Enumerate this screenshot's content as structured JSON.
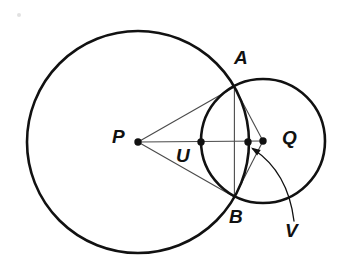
{
  "figure": {
    "title_hint": "two intersecting circles with common chord AB and center line PQ",
    "background": "#ffffff",
    "ink_color": "#111111",
    "thin_line_color": "#4a4a4a",
    "labels": {
      "P": {
        "text": "P",
        "style": "left:112px;top:127px"
      },
      "U": {
        "text": "U",
        "style": "left:176px;top:146px"
      },
      "Q": {
        "text": "Q",
        "style": "left:282px;top:128px"
      },
      "A": {
        "text": "A",
        "style": "left:234px;top:48px"
      },
      "B": {
        "text": "B",
        "style": "left:229px;top:207px"
      },
      "V": {
        "text": "V",
        "style": "left:285px;top:221px"
      }
    },
    "circles": [
      {
        "name": "circle-p",
        "cx": 138,
        "cy": 142,
        "r": 111,
        "stroke_width": 2.6
      },
      {
        "name": "circle-q",
        "cx": 263,
        "cy": 141,
        "r": 62,
        "stroke_width": 2.6
      }
    ],
    "segments": [
      {
        "name": "segment-pa",
        "x1": 138,
        "y1": 142,
        "x2": 234.4,
        "y2": 87
      },
      {
        "name": "segment-pb",
        "x1": 138,
        "y1": 142,
        "x2": 234.4,
        "y2": 197
      },
      {
        "name": "segment-pq",
        "x1": 138,
        "y1": 142,
        "x2": 263,
        "y2": 141
      },
      {
        "name": "segment-ab",
        "x1": 234.4,
        "y1": 87,
        "x2": 234.4,
        "y2": 197
      },
      {
        "name": "segment-aq",
        "x1": 234.4,
        "y1": 87,
        "x2": 263,
        "y2": 141
      },
      {
        "name": "segment-qb",
        "x1": 263,
        "y1": 141,
        "x2": 234.4,
        "y2": 197
      }
    ],
    "dots": [
      {
        "name": "point-dot-p",
        "cx": 138,
        "cy": 142,
        "r": 3.7
      },
      {
        "name": "point-dot-u",
        "cx": 201,
        "cy": 142,
        "r": 3.7
      },
      {
        "name": "point-dot-v",
        "cx": 248,
        "cy": 142,
        "r": 3.7
      },
      {
        "name": "point-dot-q",
        "cx": 263,
        "cy": 141,
        "r": 3.7
      }
    ],
    "arrow": {
      "name": "v-pointer-arrow",
      "path": "M 294,221 Q 288,172 253,149",
      "head_points": "251,147.5 260.7,150 257.1,155.4",
      "stroke_width": 1.3
    },
    "artifact": {
      "name": "scan-artifact-dot",
      "cx": 19,
      "cy": 15,
      "r": 2,
      "color": "#c8c8c8"
    }
  }
}
